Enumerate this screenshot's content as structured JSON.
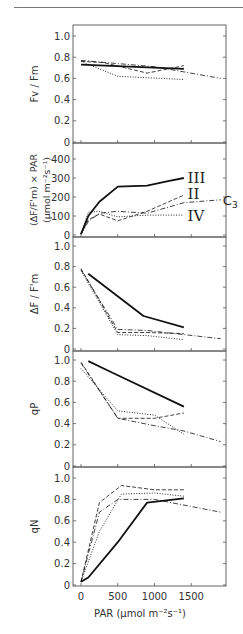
{
  "header": {
    "text": "···"
  },
  "chart_data": [
    {
      "type": "line",
      "panel": "Fv/Fm",
      "ylabel": "Fv / Fm",
      "ylim": [
        0,
        1.0
      ],
      "yticks": [
        0,
        0.2,
        0.4,
        0.6,
        0.8,
        1.0
      ],
      "ytick_labels": [
        "0",
        "0.2",
        "0.4",
        "0.6",
        "0.8",
        "1.0"
      ],
      "series": [
        {
          "name": "III",
          "style": "solid",
          "x": [
            0,
            1400
          ],
          "y": [
            0.73,
            0.69
          ]
        },
        {
          "name": "II",
          "style": "dashed",
          "x": [
            0,
            300,
            900,
            1400
          ],
          "y": [
            0.76,
            0.75,
            0.65,
            0.72
          ]
        },
        {
          "name": "IV",
          "style": "dotted",
          "x": [
            0,
            500,
            1400
          ],
          "y": [
            0.76,
            0.62,
            0.59
          ]
        },
        {
          "name": "C3",
          "style": "dashdot",
          "x": [
            0,
            500,
            1000,
            1900
          ],
          "y": [
            0.77,
            0.74,
            0.71,
            0.6
          ]
        }
      ]
    },
    {
      "type": "line",
      "panel": "electron transport",
      "ylabel": "(ΔF/F'm) × PAR",
      "ylabel2": "(μmol m⁻²s⁻¹)",
      "ylim": [
        0,
        450
      ],
      "yticks": [
        0,
        100,
        200,
        300,
        400
      ],
      "ytick_labels": [
        "0",
        "100",
        "200",
        "300",
        "400"
      ],
      "series": [
        {
          "name": "III",
          "style": "solid",
          "x": [
            0,
            100,
            250,
            500,
            900,
            1200,
            1400
          ],
          "y": [
            5,
            100,
            175,
            255,
            260,
            285,
            300
          ]
        },
        {
          "name": "II",
          "style": "dashed",
          "x": [
            0,
            100,
            250,
            500,
            900,
            1400
          ],
          "y": [
            5,
            80,
            110,
            75,
            125,
            210
          ]
        },
        {
          "name": "IV",
          "style": "dotted",
          "x": [
            0,
            100,
            250,
            500,
            900,
            1400
          ],
          "y": [
            5,
            120,
            125,
            95,
            105,
            105
          ]
        },
        {
          "name": "C3",
          "style": "dashdot",
          "x": [
            0,
            100,
            250,
            500,
            900,
            1400,
            1900
          ],
          "y": [
            5,
            70,
            115,
            125,
            115,
            170,
            185
          ]
        }
      ],
      "annotations": [
        {
          "text": "III",
          "x": 1450,
          "y": 300
        },
        {
          "text": "II",
          "x": 1450,
          "y": 215
        },
        {
          "text": "C3",
          "x": 1930,
          "y": 185
        },
        {
          "text": "IV",
          "x": 1450,
          "y": 100
        }
      ]
    },
    {
      "type": "line",
      "panel": "ΔF/F'm",
      "ylabel": "ΔF / F'm",
      "ylim": [
        0,
        1.0
      ],
      "yticks": [
        0,
        0.2,
        0.4,
        0.6,
        0.8,
        1.0
      ],
      "ytick_labels": [
        "0",
        "0.2",
        "0.4",
        "0.6",
        "0.8",
        "1.0"
      ],
      "series": [
        {
          "name": "III",
          "style": "solid",
          "x": [
            100,
            850,
            1400
          ],
          "y": [
            0.73,
            0.32,
            0.21
          ]
        },
        {
          "name": "II",
          "style": "dashed",
          "x": [
            0,
            500,
            900,
            1400
          ],
          "y": [
            0.78,
            0.16,
            0.16,
            0.15
          ]
        },
        {
          "name": "IV",
          "style": "dotted",
          "x": [
            0,
            500,
            900,
            1400
          ],
          "y": [
            0.76,
            0.14,
            0.13,
            0.09
          ]
        },
        {
          "name": "C3",
          "style": "dashdot",
          "x": [
            0,
            500,
            900,
            1400,
            1900
          ],
          "y": [
            0.77,
            0.19,
            0.18,
            0.14,
            0.1
          ]
        }
      ]
    },
    {
      "type": "line",
      "panel": "qP",
      "ylabel": "qP",
      "ylim": [
        0,
        1.0
      ],
      "yticks": [
        0,
        0.2,
        0.4,
        0.6,
        0.8,
        1.0
      ],
      "ytick_labels": [
        "0",
        "0.2",
        "0.4",
        "0.6",
        "0.8",
        "1.0"
      ],
      "series": [
        {
          "name": "III",
          "style": "solid",
          "x": [
            100,
            400,
            1400
          ],
          "y": [
            0.99,
            0.89,
            0.56
          ]
        },
        {
          "name": "II",
          "style": "dashed",
          "x": [
            0,
            500,
            1000,
            1400
          ],
          "y": [
            0.98,
            0.45,
            0.45,
            0.5
          ]
        },
        {
          "name": "IV",
          "style": "dotted",
          "x": [
            0,
            500,
            1000,
            1400
          ],
          "y": [
            0.92,
            0.52,
            0.48,
            0.3
          ]
        },
        {
          "name": "C3",
          "style": "dashdot",
          "x": [
            0,
            500,
            1000,
            1400,
            1900
          ],
          "y": [
            0.97,
            0.45,
            0.38,
            0.33,
            0.23
          ]
        }
      ]
    },
    {
      "type": "line",
      "panel": "qN",
      "ylabel": "qN",
      "xlabel": "PAR (μmol m⁻²s⁻¹)",
      "xlim": [
        -350,
        1700
      ],
      "xticks": [
        0,
        500,
        1000,
        1500
      ],
      "xtick_labels": [
        "0",
        "500",
        "1000",
        "1500"
      ],
      "ylim": [
        0,
        1.0
      ],
      "yticks": [
        0,
        0.2,
        0.4,
        0.6,
        0.8,
        1.0
      ],
      "ytick_labels": [
        "0",
        "0.2",
        "0.4",
        "0.6",
        "0.8",
        "1.0"
      ],
      "series": [
        {
          "name": "III",
          "style": "solid",
          "x": [
            0,
            100,
            500,
            900,
            1400
          ],
          "y": [
            0.03,
            0.07,
            0.4,
            0.77,
            0.81
          ]
        },
        {
          "name": "II",
          "style": "dashed",
          "x": [
            0,
            250,
            550,
            1000,
            1400
          ],
          "y": [
            0.03,
            0.77,
            0.93,
            0.89,
            0.89
          ]
        },
        {
          "name": "IV",
          "style": "dotted",
          "x": [
            0,
            250,
            550,
            1000,
            1400
          ],
          "y": [
            0.03,
            0.5,
            0.85,
            0.86,
            0.83
          ]
        },
        {
          "name": "C3",
          "style": "dashdot",
          "x": [
            0,
            250,
            500,
            1000,
            1900
          ],
          "y": [
            0.03,
            0.68,
            0.8,
            0.8,
            0.68
          ]
        }
      ]
    }
  ]
}
